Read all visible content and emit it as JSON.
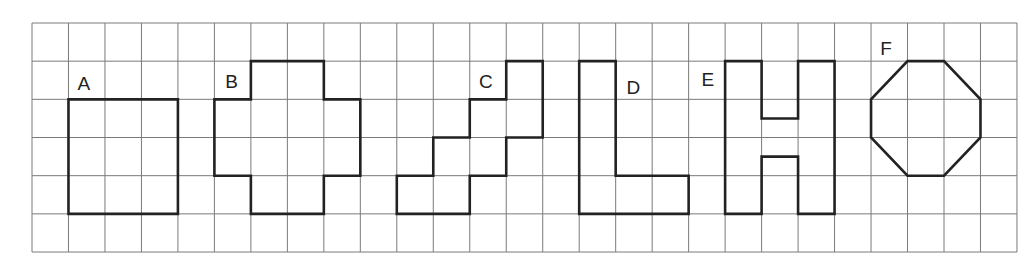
{
  "diagram": {
    "grid": {
      "origin_x": 32,
      "origin_y": 23,
      "cols": 27,
      "rows": 6,
      "cell_w": 36.48,
      "cell_h": 38.17,
      "line_color": "#7a7a7a"
    },
    "shape_color": "#222222",
    "shapes": [
      {
        "label": "A",
        "label_pos": [
          1.25,
          1.75
        ],
        "points": [
          [
            1,
            2
          ],
          [
            4,
            2
          ],
          [
            4,
            5
          ],
          [
            1,
            5
          ]
        ]
      },
      {
        "label": "B",
        "label_pos": [
          5.3,
          1.7
        ],
        "points": [
          [
            6,
            1
          ],
          [
            8,
            1
          ],
          [
            8,
            2
          ],
          [
            9,
            2
          ],
          [
            9,
            4
          ],
          [
            8,
            4
          ],
          [
            8,
            5
          ],
          [
            6,
            5
          ],
          [
            6,
            4
          ],
          [
            5,
            4
          ],
          [
            5,
            2
          ],
          [
            6,
            2
          ]
        ]
      },
      {
        "label": "C",
        "label_pos": [
          12.25,
          1.7
        ],
        "points": [
          [
            10,
            5
          ],
          [
            12,
            5
          ],
          [
            12,
            4
          ],
          [
            13,
            4
          ],
          [
            13,
            3
          ],
          [
            14,
            3
          ],
          [
            14,
            1
          ],
          [
            13,
            1
          ],
          [
            13,
            2
          ],
          [
            12,
            2
          ],
          [
            12,
            3
          ],
          [
            11,
            3
          ],
          [
            11,
            4
          ],
          [
            10,
            4
          ]
        ]
      },
      {
        "label": "D",
        "label_pos": [
          16.3,
          1.85
        ],
        "points": [
          [
            15,
            1
          ],
          [
            16,
            1
          ],
          [
            16,
            4
          ],
          [
            18,
            4
          ],
          [
            18,
            5
          ],
          [
            15,
            5
          ]
        ]
      },
      {
        "label": "E",
        "label_pos": [
          18.35,
          1.65
        ],
        "points": [
          [
            19,
            1
          ],
          [
            20,
            1
          ],
          [
            20,
            2.5
          ],
          [
            21,
            2.5
          ],
          [
            21,
            1
          ],
          [
            22,
            1
          ],
          [
            22,
            5
          ],
          [
            21,
            5
          ],
          [
            21,
            3.5
          ],
          [
            20,
            3.5
          ],
          [
            20,
            5
          ],
          [
            19,
            5
          ]
        ]
      },
      {
        "label": "F",
        "label_pos": [
          23.25,
          0.85
        ],
        "points": [
          [
            24,
            1
          ],
          [
            25,
            1
          ],
          [
            26,
            2
          ],
          [
            26,
            3
          ],
          [
            25,
            4
          ],
          [
            24,
            4
          ],
          [
            23,
            3
          ],
          [
            23,
            2
          ]
        ]
      }
    ]
  }
}
